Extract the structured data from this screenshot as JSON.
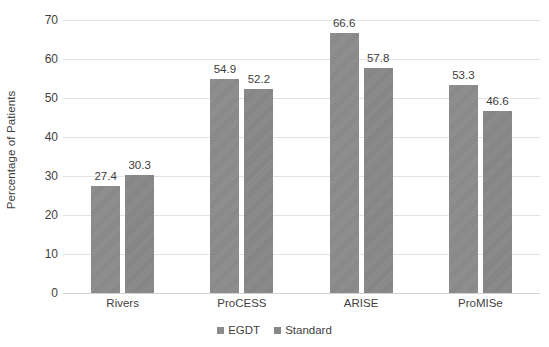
{
  "chart_data": {
    "type": "bar",
    "title": "",
    "subtitle": "",
    "xlabel": "",
    "ylabel": "Percentage of Patients",
    "categories": [
      "Rivers",
      "ProCESS",
      "ARISE",
      "ProMISe"
    ],
    "series": [
      {
        "name": "EGDT",
        "color": "#8b8b8b",
        "values": [
          27.4,
          54.9,
          66.6,
          53.3
        ]
      },
      {
        "name": "Standard",
        "color": "#878787",
        "values": [
          30.3,
          52.2,
          57.8,
          46.6
        ]
      }
    ],
    "ylim": [
      0,
      70
    ],
    "ytick_values": [
      0,
      10,
      20,
      30,
      40,
      50,
      60,
      70
    ],
    "ytick_labels": [
      "0",
      "10",
      "20",
      "30",
      "40",
      "50",
      "60",
      "70"
    ],
    "data_labels": [
      "27.4",
      "30.3",
      "54.9",
      "52.2",
      "66.6",
      "57.8",
      "53.3",
      "46.6"
    ],
    "grid": true,
    "grid_axis": "y",
    "legend_position": "bottom",
    "legend_entries": [
      "EGDT",
      "Standard"
    ],
    "background_color": "#ffffff",
    "gridline_color": "#e3e3e3"
  }
}
